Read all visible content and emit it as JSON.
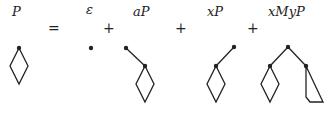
{
  "equation": {
    "lhs_label": "P",
    "equals": "=",
    "terms": [
      {
        "label": "ε",
        "shape": "single-dot"
      },
      {
        "label": "aP",
        "shape": "dot-edge-to-diamond"
      },
      {
        "label": "xP",
        "shape": "dot-edge-to-diamond-left"
      },
      {
        "label": "xMyP",
        "shape": "root-with-diamond-and-wedge"
      }
    ],
    "plus": "+"
  },
  "colors": {
    "stroke": "#222222",
    "background": "#ffffff"
  }
}
